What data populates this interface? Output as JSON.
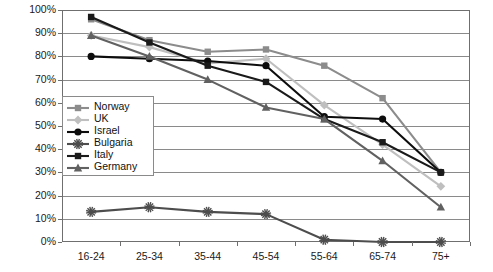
{
  "chart_data": {
    "type": "line",
    "title": "",
    "subtitle": "",
    "xlabel": "",
    "ylabel": "",
    "categories": [
      "16-24",
      "25-34",
      "35-44",
      "45-54",
      "55-64",
      "65-74",
      "75+"
    ],
    "ylim": [
      0,
      100
    ],
    "ytick_labels": [
      "100%",
      "90%",
      "80%",
      "70%",
      "60%",
      "50%",
      "40%",
      "30%",
      "20%",
      "10%",
      "0%"
    ],
    "ytick_values": [
      100,
      90,
      80,
      70,
      60,
      50,
      40,
      30,
      20,
      10,
      0
    ],
    "grid": "horizontal",
    "legend_position": "inside-left",
    "series": [
      {
        "name": "Norway",
        "color": "#8c8c8c",
        "marker": "square",
        "values": [
          96,
          87,
          82,
          83,
          76,
          62,
          30
        ]
      },
      {
        "name": "UK",
        "color": "#bfbfbf",
        "marker": "diamond",
        "values": [
          89,
          84,
          77,
          79,
          59,
          42,
          24
        ]
      },
      {
        "name": "Israel",
        "color": "#0d0d0d",
        "marker": "circle",
        "values": [
          80,
          79,
          78,
          76,
          54,
          53,
          30
        ]
      },
      {
        "name": "Bulgaria",
        "color": "#4d4d4d",
        "marker": "star",
        "values": [
          13,
          15,
          13,
          12,
          1,
          0,
          0
        ]
      },
      {
        "name": "Italy",
        "color": "#1a1a1a",
        "marker": "square",
        "values": [
          97,
          86,
          76,
          69,
          53,
          43,
          30
        ]
      },
      {
        "name": "Germany",
        "color": "#616161",
        "marker": "triangle",
        "values": [
          89,
          80,
          70,
          58,
          53,
          35,
          15
        ]
      }
    ]
  },
  "axis": {
    "y_labels": [
      "100%",
      "90%",
      "80%",
      "70%",
      "60%",
      "50%",
      "40%",
      "30%",
      "20%",
      "10%",
      "0%"
    ],
    "x_labels": [
      "16-24",
      "25-34",
      "35-44",
      "45-54",
      "55-64",
      "65-74",
      "75+"
    ]
  },
  "legend": {
    "items": [
      {
        "label": "Norway"
      },
      {
        "label": "UK"
      },
      {
        "label": "Israel"
      },
      {
        "label": "Bulgaria"
      },
      {
        "label": "Italy"
      },
      {
        "label": "Germany"
      }
    ]
  }
}
